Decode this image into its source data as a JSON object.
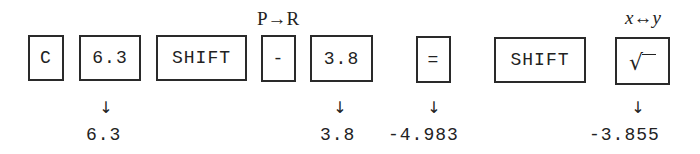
{
  "diagram": {
    "type": "calculator-key-sequence",
    "keys": [
      {
        "id": "c",
        "label": "C"
      },
      {
        "id": "num1",
        "label": "6.3"
      },
      {
        "id": "shift1",
        "label": "SHIFT"
      },
      {
        "id": "minus",
        "label": "-",
        "shift_label": "P→R"
      },
      {
        "id": "num2",
        "label": "3.8"
      },
      {
        "id": "equals",
        "label": "="
      },
      {
        "id": "shift2",
        "label": "SHIFT"
      },
      {
        "id": "sqrt",
        "label": "√",
        "icon": "square-root-icon",
        "shift_label": "x↔y"
      }
    ],
    "arrows": {
      "symbol": "↓"
    },
    "results": [
      {
        "after_key": "num1",
        "value": "6.3"
      },
      {
        "after_key": "num2",
        "value": "3.8"
      },
      {
        "after_key": "equals",
        "value": "-4.983"
      },
      {
        "after_key": "sqrt",
        "value": "-3.855"
      }
    ]
  }
}
